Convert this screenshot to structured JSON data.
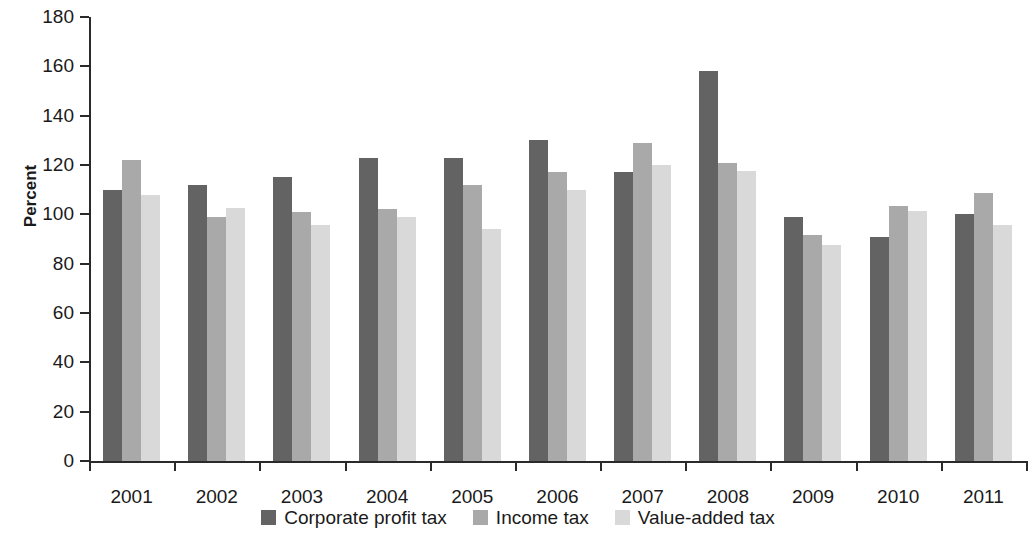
{
  "chart_data": {
    "type": "bar",
    "title": "",
    "subtitle": "",
    "xlabel": "",
    "ylabel": "Percent",
    "ylim": [
      0,
      180
    ],
    "ytick_step": 20,
    "yticks": [
      0,
      20,
      40,
      60,
      80,
      100,
      120,
      140,
      160,
      180
    ],
    "grid": false,
    "legend_position": "bottom-center",
    "orientation": "vertical",
    "grouping": "grouped",
    "categories": [
      "2001",
      "2002",
      "2003",
      "2004",
      "2005",
      "2006",
      "2007",
      "2008",
      "2009",
      "2010",
      "2011"
    ],
    "series": [
      {
        "name": "Corporate profit tax",
        "color": "#636363",
        "values": [
          110,
          112,
          115,
          123,
          123,
          130,
          117,
          158,
          99,
          91,
          100
        ]
      },
      {
        "name": "Income tax",
        "color": "#a9a9a9",
        "values": [
          122,
          99,
          101,
          102,
          112,
          117,
          129,
          121,
          91.5,
          103.5,
          108.5
        ]
      },
      {
        "name": "Value-added tax",
        "color": "#d9d9d9",
        "values": [
          108,
          102.5,
          95.5,
          99,
          94,
          110,
          120,
          117.5,
          87.5,
          101.5,
          95.5
        ]
      }
    ],
    "colors": {
      "axis": "#2a2a2a",
      "text": "#1a1a1a",
      "background": "#ffffff",
      "series_dark": "#636363",
      "series_medium": "#a9a9a9",
      "series_light": "#d9d9d9"
    }
  }
}
